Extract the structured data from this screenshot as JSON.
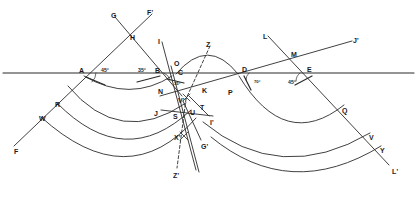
{
  "figure": {
    "type": "geometric-ray-diagram",
    "stroke_color": "#2b2b2b",
    "background": "#ffffff"
  },
  "baseline": {
    "name": "interface-line",
    "y": 73,
    "x_start": 3,
    "x_end": 414
  },
  "angles": [
    {
      "id": "ang-A",
      "text": "45°",
      "x": 101,
      "y": 68,
      "vertex": "A"
    },
    {
      "id": "ang-B",
      "text": "35°",
      "x": 138,
      "y": 68,
      "vertex": "B"
    },
    {
      "id": "ang-C",
      "text": "35°",
      "x": 174,
      "y": 82,
      "vertex": "C"
    },
    {
      "id": "ang-D",
      "text": "70°",
      "x": 254,
      "y": 80,
      "vertex": "D"
    },
    {
      "id": "ang-E",
      "text": "45°",
      "x": 288,
      "y": 80,
      "vertex": "E"
    }
  ],
  "points": [
    {
      "id": "A",
      "text": "A",
      "x": 79,
      "y": 67
    },
    {
      "id": "B",
      "text": "B",
      "x": 155,
      "y": 67
    },
    {
      "id": "C",
      "text": "C",
      "x": 178,
      "y": 69
    },
    {
      "id": "D",
      "text": "D",
      "x": 242,
      "y": 66
    },
    {
      "id": "E",
      "text": "E",
      "x": 307,
      "y": 66
    },
    {
      "id": "G",
      "text": "G",
      "x": 111,
      "y": 12
    },
    {
      "id": "Fp",
      "text": "F'",
      "x": 147,
      "y": 9
    },
    {
      "id": "H",
      "text": "H",
      "x": 130,
      "y": 34
    },
    {
      "id": "I",
      "text": "I",
      "x": 158,
      "y": 38
    },
    {
      "id": "Z",
      "text": "Z",
      "x": 206,
      "y": 41
    },
    {
      "id": "L",
      "text": "L",
      "x": 263,
      "y": 33
    },
    {
      "id": "M",
      "text": "M",
      "x": 291,
      "y": 51
    },
    {
      "id": "Jp",
      "text": "J'",
      "x": 353,
      "y": 37
    },
    {
      "id": "O",
      "text": "O",
      "x": 174,
      "y": 60
    },
    {
      "id": "N",
      "text": "N",
      "x": 158,
      "y": 88
    },
    {
      "id": "K",
      "text": "K",
      "x": 202,
      "y": 87
    },
    {
      "id": "P",
      "text": "P",
      "x": 228,
      "y": 89
    },
    {
      "id": "Vp",
      "text": "V'",
      "x": 178,
      "y": 97
    },
    {
      "id": "T",
      "text": "T",
      "x": 200,
      "y": 104
    },
    {
      "id": "J",
      "text": "J",
      "x": 154,
      "y": 110
    },
    {
      "id": "S",
      "text": "S",
      "x": 173,
      "y": 113
    },
    {
      "id": "U",
      "text": "U",
      "x": 190,
      "y": 109
    },
    {
      "id": "Ip",
      "text": "I'",
      "x": 210,
      "y": 119
    },
    {
      "id": "R",
      "text": "R",
      "x": 55,
      "y": 101
    },
    {
      "id": "W",
      "text": "W",
      "x": 39,
      "y": 115
    },
    {
      "id": "F",
      "text": "F",
      "x": 14,
      "y": 148
    },
    {
      "id": "Xp",
      "text": "X'",
      "x": 174,
      "y": 134
    },
    {
      "id": "Gp",
      "text": "G'",
      "x": 201,
      "y": 143
    },
    {
      "id": "Zp",
      "text": "Z'",
      "x": 173,
      "y": 172
    },
    {
      "id": "Q",
      "text": "Q",
      "x": 342,
      "y": 107
    },
    {
      "id": "V",
      "text": "V",
      "x": 369,
      "y": 134
    },
    {
      "id": "Y",
      "text": "Y",
      "x": 380,
      "y": 147
    },
    {
      "id": "Lp",
      "text": "L'",
      "x": 392,
      "y": 168
    }
  ]
}
